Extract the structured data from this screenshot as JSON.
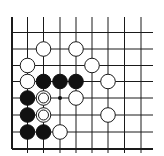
{
  "board": {
    "visible_columns": 9,
    "visible_rows": 8,
    "edges": [
      "left",
      "bottom"
    ],
    "colors": {
      "black": "#111111",
      "white": "#ffffff",
      "line": "#1a1a1a"
    }
  },
  "stones": [
    {
      "color": "white",
      "col": 2,
      "row": 1
    },
    {
      "color": "white",
      "col": 4,
      "row": 1
    },
    {
      "color": "white",
      "col": 1,
      "row": 2
    },
    {
      "color": "white",
      "col": 5,
      "row": 2
    },
    {
      "color": "white",
      "col": 1,
      "row": 3
    },
    {
      "color": "black",
      "col": 2,
      "row": 3
    },
    {
      "color": "black",
      "col": 3,
      "row": 3
    },
    {
      "color": "black",
      "col": 4,
      "row": 3
    },
    {
      "color": "white",
      "col": 6,
      "row": 3
    },
    {
      "color": "black",
      "col": 1,
      "row": 4
    },
    {
      "color": "white",
      "col": 2,
      "row": 4,
      "marked": true
    },
    {
      "color": "white",
      "col": 4,
      "row": 4
    },
    {
      "color": "black",
      "col": 1,
      "row": 5
    },
    {
      "color": "white",
      "col": 2,
      "row": 5,
      "marked": true
    },
    {
      "color": "white",
      "col": 6,
      "row": 5
    },
    {
      "color": "black",
      "col": 1,
      "row": 6
    },
    {
      "color": "black",
      "col": 2,
      "row": 6
    },
    {
      "color": "white",
      "col": 3,
      "row": 6
    }
  ],
  "point_marks": [
    {
      "type": "dot",
      "col": 3,
      "row": 4
    }
  ]
}
